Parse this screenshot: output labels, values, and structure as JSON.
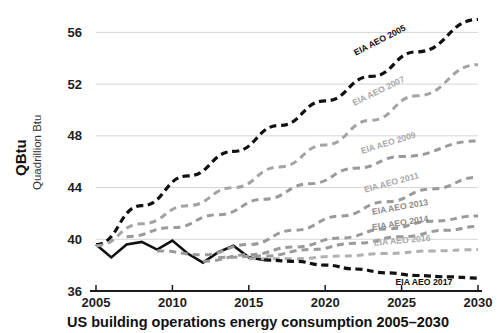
{
  "chart_data": {
    "type": "line",
    "title": "US building operations energy consumption 2005–2030",
    "ylabel_main": "QBtu",
    "ylabel_sub": "Quadrillion Btu",
    "xlabel": "",
    "xlim": [
      2005,
      2030
    ],
    "ylim": [
      36,
      57.5
    ],
    "xticks": [
      2005,
      2010,
      2015,
      2020,
      2025,
      2030
    ],
    "yticks": [
      36,
      40,
      44,
      48,
      52,
      56
    ],
    "grid": "horizontal",
    "legend_position": "inline-at-line-ends",
    "series": [
      {
        "name": "Historical",
        "label": "",
        "style": "solid",
        "color": "#111111",
        "x": [
          2005,
          2006,
          2007,
          2008,
          2009,
          2010,
          2011,
          2012,
          2013,
          2014,
          2015,
          2016
        ],
        "values": [
          39.6,
          38.6,
          39.6,
          39.8,
          39.2,
          39.9,
          38.9,
          38.2,
          39.0,
          39.5,
          38.6,
          38.4
        ]
      },
      {
        "name": "EIA AEO 2005",
        "label": "EIA AEO 2005",
        "style": "dashed",
        "color": "#111111",
        "x": [
          2005,
          2008,
          2011,
          2014,
          2017,
          2020,
          2023,
          2026,
          2030
        ],
        "values": [
          39.6,
          42.6,
          44.9,
          46.8,
          48.8,
          50.7,
          52.6,
          54.5,
          57.0
        ]
      },
      {
        "name": "EIA AEO 2007",
        "label": "EIA AEO 2007",
        "style": "dashed",
        "color": "#a3a3a3",
        "x": [
          2005,
          2008,
          2011,
          2014,
          2017,
          2020,
          2023,
          2026,
          2030
        ],
        "values": [
          39.5,
          41.2,
          42.6,
          44.0,
          45.6,
          47.3,
          49.2,
          51.1,
          53.5
        ]
      },
      {
        "name": "EIA AEO 2009",
        "label": "EIA AEO 2009",
        "style": "dashed",
        "color": "#9a9a9a",
        "x": [
          2007,
          2010,
          2013,
          2016,
          2019,
          2022,
          2025,
          2030
        ],
        "values": [
          40.2,
          40.9,
          41.9,
          43.1,
          44.3,
          45.5,
          46.4,
          47.6
        ]
      },
      {
        "name": "EIA AEO 2011",
        "label": "EIA AEO 2011",
        "style": "dashed",
        "color": "#9a9a9a",
        "x": [
          2009,
          2012,
          2015,
          2018,
          2021,
          2024,
          2027,
          2030
        ],
        "values": [
          39.1,
          38.8,
          39.6,
          40.7,
          41.8,
          42.9,
          43.9,
          44.8
        ]
      },
      {
        "name": "EIA AEO 2013",
        "label": "EIA AEO 2013",
        "style": "dashed",
        "color": "#9a9a9a",
        "x": [
          2012,
          2015,
          2018,
          2021,
          2024,
          2027,
          2030
        ],
        "values": [
          38.3,
          38.8,
          39.4,
          40.1,
          40.8,
          41.4,
          41.8
        ]
      },
      {
        "name": "EIA AEO 2014",
        "label": "EIA AEO 2014",
        "style": "dashed",
        "color": "#9a9a9a",
        "x": [
          2013,
          2016,
          2019,
          2022,
          2025,
          2028,
          2030
        ],
        "values": [
          38.6,
          38.7,
          39.2,
          39.7,
          40.2,
          40.7,
          41.0
        ]
      },
      {
        "name": "EIA AEO 2016",
        "label": "EIA AEO 2016",
        "style": "dashed",
        "color": "#b0b0b0",
        "x": [
          2015,
          2018,
          2021,
          2024,
          2027,
          2030
        ],
        "values": [
          38.5,
          38.5,
          38.7,
          38.9,
          39.1,
          39.2
        ]
      },
      {
        "name": "EIA AEO 2017",
        "label": "EIA AEO 2017",
        "style": "dashed",
        "color": "#111111",
        "x": [
          2016,
          2018,
          2020,
          2022,
          2024,
          2026,
          2028,
          2030
        ],
        "values": [
          38.4,
          38.3,
          38.0,
          37.7,
          37.4,
          37.2,
          37.1,
          37.0
        ]
      }
    ],
    "series_labels": [
      {
        "text": "EIA AEO 2005",
        "x": 2022.0,
        "y": 54.2,
        "rotate": -27,
        "tone": "dark"
      },
      {
        "text": "EIA AEO 2007",
        "x": 2021.9,
        "y": 50.3,
        "rotate": -26,
        "tone": "light"
      },
      {
        "text": "EIA AEO 2009",
        "x": 2022.4,
        "y": 46.6,
        "rotate": -17,
        "tone": "light"
      },
      {
        "text": "EIA AEO 2011",
        "x": 2022.6,
        "y": 43.6,
        "rotate": -15,
        "tone": "light"
      },
      {
        "text": "EIA AEO 2013",
        "x": 2023.1,
        "y": 41.9,
        "rotate": -10,
        "tone": "mid"
      },
      {
        "text": "EIA AEO 2014",
        "x": 2023.1,
        "y": 40.7,
        "rotate": -9,
        "tone": "mid"
      },
      {
        "text": "EIA AEO 2016",
        "x": 2023.2,
        "y": 39.5,
        "rotate": -5,
        "tone": "light"
      },
      {
        "text": "EIA AEO 2017",
        "x": 2024.6,
        "y": 36.45,
        "rotate": 0,
        "tone": "dark"
      }
    ]
  },
  "colors": {
    "background": "#ffffff",
    "axis": "#1a1a1a",
    "grid": "#d6d6d6",
    "dark_series": "#111111",
    "gray_series": "#9a9a9a",
    "light_series": "#b0b0b0"
  }
}
